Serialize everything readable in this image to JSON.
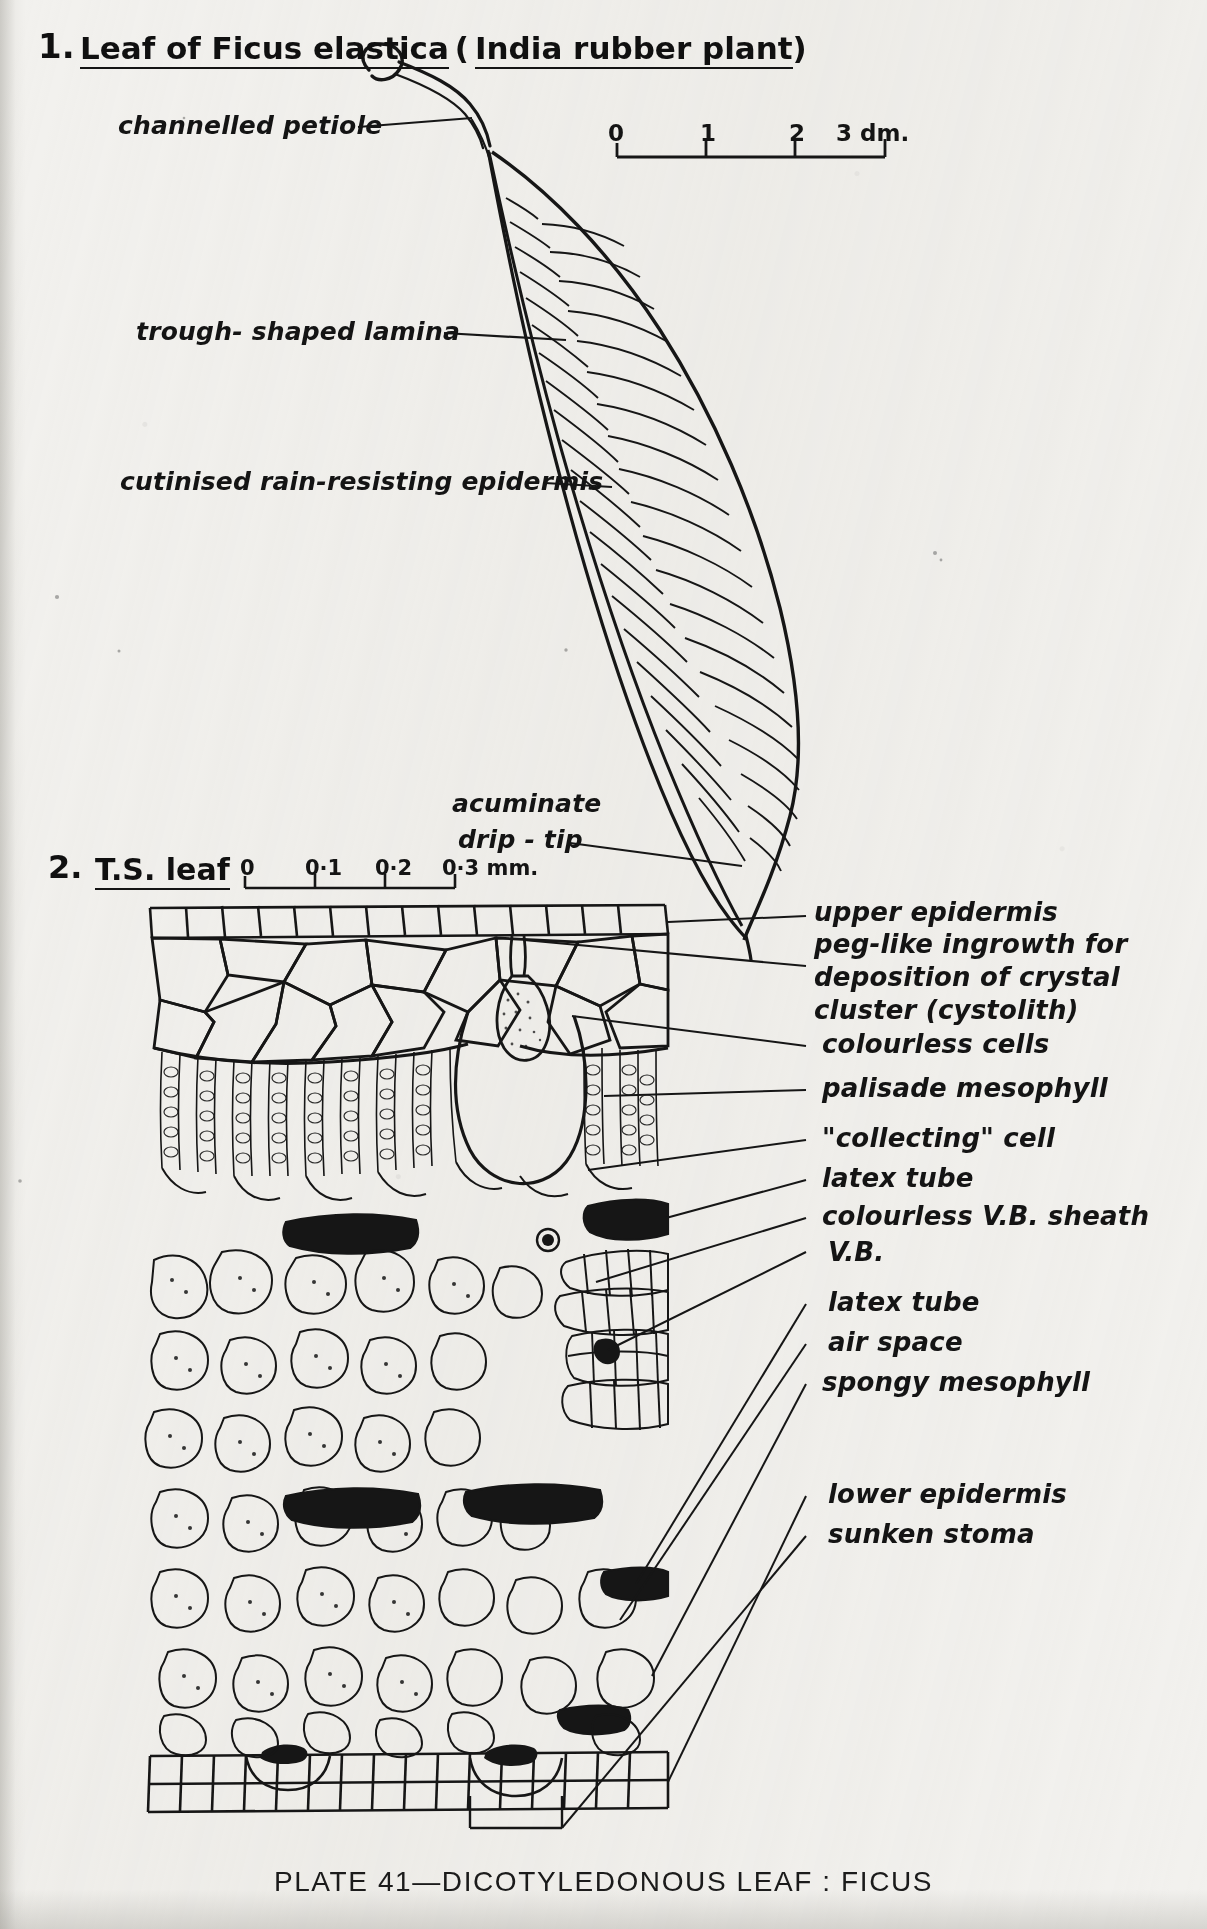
{
  "plate": {
    "caption": "PLATE 41—DICOTYLEDONOUS LEAF : FICUS"
  },
  "figure1": {
    "number": "1.",
    "title_part1": "Leaf of Ficus elastica",
    "title_part2": "(",
    "title_part3": "India rubber plant",
    "title_part4": ")",
    "labels": [
      {
        "id": "channelled-petiole",
        "text": "channelled petiole"
      },
      {
        "id": "trough-shaped-lamina",
        "text": "trough- shaped  lamina"
      },
      {
        "id": "cutinised-epidermis",
        "text": "cutinised rain-resisting epidermis"
      },
      {
        "id": "acuminate-drip-tip-line1",
        "text": "acuminate"
      },
      {
        "id": "acuminate-drip-tip-line2",
        "text": "drip - tip"
      }
    ],
    "scale": {
      "ticks": [
        "0",
        "1",
        "2",
        "3 dm."
      ],
      "unit": "dm."
    }
  },
  "figure2": {
    "number": "2.",
    "title": "T.S. leaf",
    "scale": {
      "ticks": [
        "0",
        "0·1",
        "0·2",
        "0·3 mm."
      ],
      "unit": "mm."
    },
    "labels": [
      {
        "id": "upper-epidermis",
        "text": "upper epidermis"
      },
      {
        "id": "peg-like-ingrowth-1",
        "text": "peg-like ingrowth for"
      },
      {
        "id": "peg-like-ingrowth-2",
        "text": "deposition of crystal"
      },
      {
        "id": "peg-like-ingrowth-3",
        "text": "cluster (cystolith)"
      },
      {
        "id": "colourless-cells",
        "text": "colourless cells"
      },
      {
        "id": "palisade-mesophyll",
        "text": "palisade mesophyll"
      },
      {
        "id": "collecting-cell",
        "text": "\"collecting\" cell"
      },
      {
        "id": "latex-tube-upper",
        "text": "latex tube"
      },
      {
        "id": "colourless-vb-sheath",
        "text": "colourless V.B. sheath"
      },
      {
        "id": "vb",
        "text": "V.B."
      },
      {
        "id": "latex-tube-lower",
        "text": "latex tube"
      },
      {
        "id": "air-space",
        "text": "air space"
      },
      {
        "id": "spongy-mesophyll",
        "text": "spongy mesophyll"
      },
      {
        "id": "lower-epidermis",
        "text": "lower epidermis"
      },
      {
        "id": "sunken-stoma",
        "text": "sunken stoma"
      }
    ]
  },
  "colors": {
    "paper": "#f2f1ee",
    "ink": "#161616"
  }
}
